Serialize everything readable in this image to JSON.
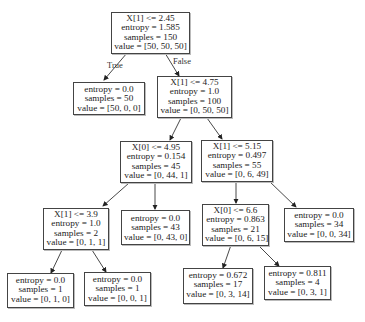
{
  "diagram": {
    "type": "decision-tree",
    "nodes": [
      {
        "id": "n0",
        "split": "X[1] <= 2.45",
        "entropy": "entropy = 1.585",
        "samples": "samples = 150",
        "value": "value = [50, 50, 50]"
      },
      {
        "id": "n1",
        "split": "",
        "entropy": "entropy = 0.0",
        "samples": "samples = 50",
        "value": "value = [50, 0, 0]"
      },
      {
        "id": "n2",
        "split": "X[1] <= 4.75",
        "entropy": "entropy = 1.0",
        "samples": "samples = 100",
        "value": "value = [0, 50, 50]"
      },
      {
        "id": "n3",
        "split": "X[0] <= 4.95",
        "entropy": "entropy = 0.154",
        "samples": "samples = 45",
        "value": "value = [0, 44, 1]"
      },
      {
        "id": "n4",
        "split": "X[1] <= 5.15",
        "entropy": "entropy = 0.497",
        "samples": "samples = 55",
        "value": "value = [0, 6, 49]"
      },
      {
        "id": "n5",
        "split": "X[1] <= 3.9",
        "entropy": "entropy = 1.0",
        "samples": "samples = 2",
        "value": "value = [0, 1, 1]"
      },
      {
        "id": "n6",
        "split": "",
        "entropy": "entropy = 0.0",
        "samples": "samples = 43",
        "value": "value = [0, 43, 0]"
      },
      {
        "id": "n7",
        "split": "X[0] <= 6.6",
        "entropy": "entropy = 0.863",
        "samples": "samples = 21",
        "value": "value = [0, 6, 15]"
      },
      {
        "id": "n8",
        "split": "",
        "entropy": "entropy = 0.0",
        "samples": "samples = 34",
        "value": "value = [0, 0, 34]"
      },
      {
        "id": "n9",
        "split": "",
        "entropy": "entropy = 0.0",
        "samples": "samples = 1",
        "value": "value = [0, 1, 0]"
      },
      {
        "id": "n10",
        "split": "",
        "entropy": "entropy = 0.0",
        "samples": "samples = 1",
        "value": "value = [0, 0, 1]"
      },
      {
        "id": "n11",
        "split": "",
        "entropy": "entropy = 0.672",
        "samples": "samples = 17",
        "value": "value = [0, 3, 14]"
      },
      {
        "id": "n12",
        "split": "",
        "entropy": "entropy = 0.811",
        "samples": "samples = 4",
        "value": "value = [0, 3, 1]"
      }
    ],
    "edges": [
      {
        "from": "n0",
        "to": "n1",
        "label": "True"
      },
      {
        "from": "n0",
        "to": "n2",
        "label": "False"
      },
      {
        "from": "n2",
        "to": "n3",
        "label": ""
      },
      {
        "from": "n2",
        "to": "n4",
        "label": ""
      },
      {
        "from": "n3",
        "to": "n5",
        "label": ""
      },
      {
        "from": "n3",
        "to": "n6",
        "label": ""
      },
      {
        "from": "n4",
        "to": "n7",
        "label": ""
      },
      {
        "from": "n4",
        "to": "n8",
        "label": ""
      },
      {
        "from": "n5",
        "to": "n9",
        "label": ""
      },
      {
        "from": "n5",
        "to": "n10",
        "label": ""
      },
      {
        "from": "n7",
        "to": "n11",
        "label": ""
      },
      {
        "from": "n7",
        "to": "n12",
        "label": ""
      }
    ],
    "colors": {
      "border": "#444444",
      "background": "#ffffff",
      "text": "#222222",
      "edge": "#333333"
    }
  }
}
